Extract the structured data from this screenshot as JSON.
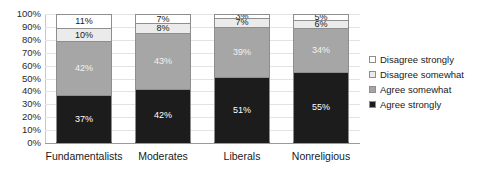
{
  "chart_data": {
    "type": "bar",
    "subtype": "stacked-100-percent",
    "title": "",
    "xlabel": "",
    "ylabel": "",
    "ylim": [
      0,
      100
    ],
    "ytick_labels": [
      "100%",
      "90%",
      "80%",
      "70%",
      "60%",
      "50%",
      "40%",
      "30%",
      "20%",
      "10%",
      "0%"
    ],
    "ytick_values": [
      100,
      90,
      80,
      70,
      60,
      50,
      40,
      30,
      20,
      10,
      0
    ],
    "grid": true,
    "legend_position": "right",
    "categories": [
      "Fundamentalists",
      "Moderates",
      "Liberals",
      "Nonreligious"
    ],
    "series": [
      {
        "name": "Agree strongly",
        "color": "#1c1c1c",
        "values": [
          37,
          42,
          51,
          55
        ],
        "labels": [
          "37%",
          "42%",
          "51%",
          "55%"
        ]
      },
      {
        "name": "Agree somewhat",
        "color": "#a6a6a6",
        "values": [
          42,
          43,
          39,
          34
        ],
        "labels": [
          "42%",
          "43%",
          "39%",
          "34%"
        ]
      },
      {
        "name": "Disagree somewhat",
        "color": "#ebebeb",
        "values": [
          10,
          8,
          7,
          6
        ],
        "labels": [
          "10%",
          "8%",
          "7%",
          "6%"
        ]
      },
      {
        "name": "Disagree strongly",
        "color": "#ffffff",
        "values": [
          11,
          7,
          3,
          5
        ],
        "labels": [
          "11%",
          "7%",
          "3%",
          "5%"
        ]
      }
    ],
    "legend_order": [
      "Disagree strongly",
      "Disagree somewhat",
      "Agree somewhat",
      "Agree strongly"
    ],
    "stack_order_top_to_bottom": [
      "Disagree strongly",
      "Disagree somewhat",
      "Agree somewhat",
      "Agree strongly"
    ]
  },
  "axis": {
    "y_ticks": [
      {
        "label": "100%"
      },
      {
        "label": "90%"
      },
      {
        "label": "80%"
      },
      {
        "label": "70%"
      },
      {
        "label": "60%"
      },
      {
        "label": "50%"
      },
      {
        "label": "40%"
      },
      {
        "label": "30%"
      },
      {
        "label": "20%"
      },
      {
        "label": "10%"
      },
      {
        "label": "0%"
      }
    ],
    "x_categories": [
      {
        "label": "Fundamentalists"
      },
      {
        "label": "Moderates"
      },
      {
        "label": "Liberals"
      },
      {
        "label": "Nonreligious"
      }
    ]
  },
  "bars": [
    {
      "category": "Fundamentalists",
      "segments": [
        {
          "series": "Disagree strongly",
          "value": 11,
          "label": "11%",
          "swatch": "#ffffff"
        },
        {
          "series": "Disagree somewhat",
          "value": 10,
          "label": "10%",
          "swatch": "#ebebeb"
        },
        {
          "series": "Agree somewhat",
          "value": 42,
          "label": "42%",
          "swatch": "#a6a6a6"
        },
        {
          "series": "Agree strongly",
          "value": 37,
          "label": "37%",
          "swatch": "#1c1c1c"
        }
      ]
    },
    {
      "category": "Moderates",
      "segments": [
        {
          "series": "Disagree strongly",
          "value": 7,
          "label": "7%",
          "swatch": "#ffffff"
        },
        {
          "series": "Disagree somewhat",
          "value": 8,
          "label": "8%",
          "swatch": "#ebebeb"
        },
        {
          "series": "Agree somewhat",
          "value": 43,
          "label": "43%",
          "swatch": "#a6a6a6"
        },
        {
          "series": "Agree strongly",
          "value": 42,
          "label": "42%",
          "swatch": "#1c1c1c"
        }
      ]
    },
    {
      "category": "Liberals",
      "segments": [
        {
          "series": "Disagree strongly",
          "value": 3,
          "label": "3%",
          "swatch": "#ffffff"
        },
        {
          "series": "Disagree somewhat",
          "value": 7,
          "label": "7%",
          "swatch": "#ebebeb"
        },
        {
          "series": "Agree somewhat",
          "value": 39,
          "label": "39%",
          "swatch": "#a6a6a6"
        },
        {
          "series": "Agree strongly",
          "value": 51,
          "label": "51%",
          "swatch": "#1c1c1c"
        }
      ]
    },
    {
      "category": "Nonreligious",
      "segments": [
        {
          "series": "Disagree strongly",
          "value": 5,
          "label": "5%",
          "swatch": "#ffffff"
        },
        {
          "series": "Disagree somewhat",
          "value": 6,
          "label": "6%",
          "swatch": "#ebebeb"
        },
        {
          "series": "Agree somewhat",
          "value": 34,
          "label": "34%",
          "swatch": "#a6a6a6"
        },
        {
          "series": "Agree strongly",
          "value": 55,
          "label": "55%",
          "swatch": "#1c1c1c"
        }
      ]
    }
  ],
  "legend": {
    "items": [
      {
        "label": "Disagree strongly",
        "swatch": "#ffffff"
      },
      {
        "label": "Disagree somewhat",
        "swatch": "#ebebeb"
      },
      {
        "label": "Agree somewhat",
        "swatch": "#a6a6a6"
      },
      {
        "label": "Agree strongly",
        "swatch": "#1c1c1c"
      }
    ]
  },
  "title_strip": {
    "text": ""
  }
}
